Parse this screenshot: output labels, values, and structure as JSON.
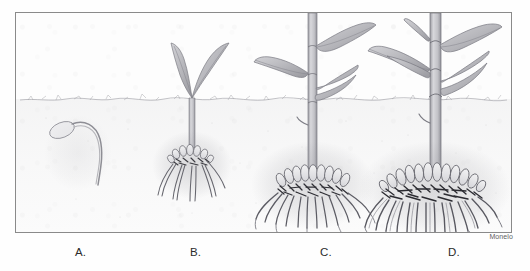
{
  "figure": {
    "signature": "Monelo",
    "frame": {
      "border_color": "#8a8a8a",
      "background_color": "#fdfdfd"
    },
    "medium": "pencil drawing",
    "soil_line_label": "soil surface",
    "colors": {
      "pencil_dark": "#3a3a3c",
      "pencil_mid": "#6e6e72",
      "pencil_light": "#a9a9ae",
      "leaf_fill": "#b9b9bd",
      "stem_fill": "#c9c9cd",
      "root_fill": "#e6e6e8",
      "soil_tint": "#96969b",
      "label_text": "#2b2b2b",
      "signature_text": "#5f5f5f"
    },
    "stages": [
      {
        "id": "a",
        "label": "A.",
        "name": "germinating-seed",
        "description": "Germinating seed with curved radicle, entirely below soil level",
        "leaf_count": 0,
        "shoot_height": 0,
        "root_type": "single radicle",
        "label_x": 75
      },
      {
        "id": "b",
        "label": "B.",
        "name": "young-seedling",
        "description": "Young seedling with two emerged leaves and small fibrous root crown",
        "leaf_count": 2,
        "shoot_height": 56,
        "root_type": "small fibrous root cluster",
        "label_x": 190
      },
      {
        "id": "c",
        "label": "C.",
        "name": "juvenile-plant",
        "description": "Juvenile plant with three leaves, thickening stem and swelling storage roots",
        "leaf_count": 3,
        "shoot_height": 120,
        "root_type": "developing tuberous root crown",
        "label_x": 320
      },
      {
        "id": "d",
        "label": "D.",
        "name": "mature-plant",
        "description": "Mature plant with four leaves and a dense crown of enlarged storage roots",
        "leaf_count": 4,
        "shoot_height": 130,
        "root_type": "dense mature tuberous root mass",
        "label_x": 448
      }
    ]
  }
}
